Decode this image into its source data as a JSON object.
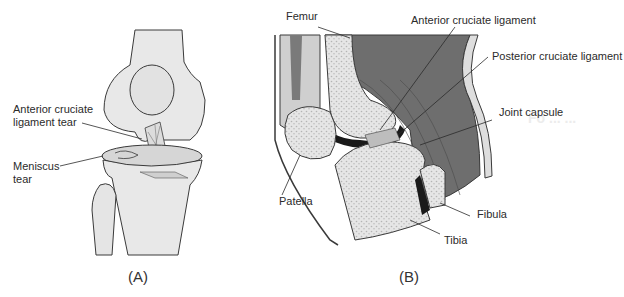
{
  "figure": {
    "panel_a": {
      "caption": "(A)",
      "labels": {
        "acl_tear_line1": "Anterior cruciate",
        "acl_tear_line2": "ligament tear",
        "meniscus_line1": "Meniscus",
        "meniscus_line2": "tear"
      }
    },
    "panel_b": {
      "caption": "(B)",
      "labels": {
        "femur": "Femur",
        "acl": "Anterior cruciate ligament",
        "pcl": "Posterior cruciate ligament",
        "joint_capsule": "Joint capsule",
        "patella": "Patella",
        "fibula": "Fibula",
        "tibia": "Tibia"
      }
    },
    "colors": {
      "bone": "#e6e6e6",
      "bone_dots": "#b5b5b5",
      "muscle": "#6e6e6e",
      "muscle_light": "#a0a0a0",
      "outline": "#3a3a3a",
      "cavity": "#1a1a1a"
    }
  }
}
